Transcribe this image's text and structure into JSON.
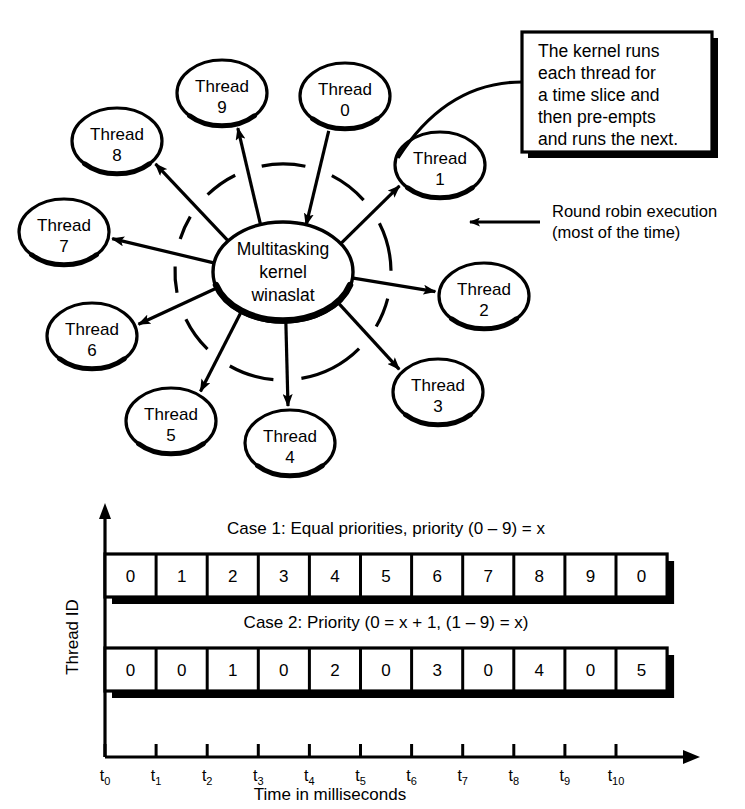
{
  "diagram": {
    "kernel": {
      "lines": [
        "Multitasking",
        "kernel",
        "winaslat"
      ]
    },
    "threads": [
      {
        "id": "0",
        "label_line1": "Thread",
        "label_line2": "0",
        "cx": 345,
        "cy": 96,
        "rx": 45,
        "ry": 33,
        "dir": "in"
      },
      {
        "id": "1",
        "label_line1": "Thread",
        "label_line2": "1",
        "cx": 440,
        "cy": 165,
        "rx": 45,
        "ry": 33,
        "dir": "out"
      },
      {
        "id": "2",
        "label_line1": "Thread",
        "label_line2": "2",
        "cx": 484,
        "cy": 296,
        "rx": 45,
        "ry": 33,
        "dir": "out"
      },
      {
        "id": "3",
        "label_line1": "Thread",
        "label_line2": "3",
        "cx": 438,
        "cy": 392,
        "rx": 45,
        "ry": 33,
        "dir": "out"
      },
      {
        "id": "4",
        "label_line1": "Thread",
        "label_line2": "4",
        "cx": 290,
        "cy": 443,
        "rx": 45,
        "ry": 33,
        "dir": "out"
      },
      {
        "id": "5",
        "label_line1": "Thread",
        "label_line2": "5",
        "cx": 171,
        "cy": 421,
        "rx": 45,
        "ry": 33,
        "dir": "out"
      },
      {
        "id": "6",
        "label_line1": "Thread",
        "label_line2": "6",
        "cx": 92,
        "cy": 336,
        "rx": 45,
        "ry": 33,
        "dir": "out"
      },
      {
        "id": "7",
        "label_line1": "Thread",
        "label_line2": "7",
        "cx": 64,
        "cy": 232,
        "rx": 45,
        "ry": 33,
        "dir": "out"
      },
      {
        "id": "8",
        "label_line1": "Thread",
        "label_line2": "8",
        "cx": 117,
        "cy": 141,
        "rx": 45,
        "ry": 33,
        "dir": "out"
      },
      {
        "id": "9",
        "label_line1": "Thread",
        "label_line2": "9",
        "cx": 222,
        "cy": 93,
        "rx": 45,
        "ry": 33,
        "dir": "out"
      }
    ],
    "callout": {
      "lines": [
        "The kernel runs",
        "each thread for",
        "a time slice and",
        "then pre-empts",
        "and runs the next."
      ]
    },
    "round_robin": {
      "lines": [
        "Round robin execution",
        "(most of the time)"
      ]
    }
  },
  "chart_data": {
    "type": "bar",
    "title": "",
    "xlabel": "Time in milliseconds",
    "ylabel": "Thread ID",
    "grid": false,
    "legend": "none",
    "x": [
      "t0",
      "t1",
      "t2",
      "t3",
      "t4",
      "t5",
      "t6",
      "t7",
      "t8",
      "t9",
      "t10"
    ],
    "tick_labels": [
      {
        "base": "t",
        "sub": "0"
      },
      {
        "base": "t",
        "sub": "1"
      },
      {
        "base": "t",
        "sub": "2"
      },
      {
        "base": "t",
        "sub": "3"
      },
      {
        "base": "t",
        "sub": "4"
      },
      {
        "base": "t",
        "sub": "5"
      },
      {
        "base": "t",
        "sub": "6"
      },
      {
        "base": "t",
        "sub": "7"
      },
      {
        "base": "t",
        "sub": "8"
      },
      {
        "base": "t",
        "sub": "9"
      },
      {
        "base": "t",
        "sub": "10"
      }
    ],
    "series": [
      {
        "name": "Case 1: Equal priorities, priority (0 – 9) = x",
        "values": [
          "0",
          "1",
          "2",
          "3",
          "4",
          "5",
          "6",
          "7",
          "8",
          "9",
          "0"
        ]
      },
      {
        "name": "Case 2: Priority (0 = x + 1, (1 – 9) = x)",
        "values": [
          "0",
          "0",
          "1",
          "0",
          "2",
          "0",
          "3",
          "0",
          "4",
          "0",
          "5"
        ]
      }
    ]
  },
  "colors": {
    "ink": "#000000",
    "paper": "#ffffff"
  }
}
